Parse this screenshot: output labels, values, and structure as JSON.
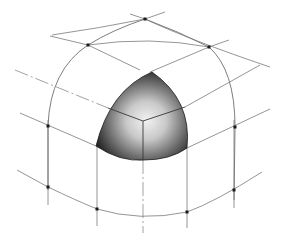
{
  "figure": {
    "colors": {
      "background": "#ffffff",
      "line": "#6e6e6e",
      "sphere_dark": "#1e1e1e",
      "sphere_light": "#e6e6e6",
      "dot": "#1a1a1a"
    },
    "vertices": [
      {
        "id": "top",
        "x": 145,
        "y": 19
      },
      {
        "id": "upper-left",
        "x": 88,
        "y": 45
      },
      {
        "id": "upper-right",
        "x": 209,
        "y": 47
      },
      {
        "id": "left",
        "x": 48,
        "y": 126
      },
      {
        "id": "right",
        "x": 235,
        "y": 127
      },
      {
        "id": "lower-left",
        "x": 48,
        "y": 187
      },
      {
        "id": "lower-mid-left",
        "x": 97,
        "y": 209
      },
      {
        "id": "lower-mid-right",
        "x": 187,
        "y": 212
      },
      {
        "id": "lower-right",
        "x": 234,
        "y": 190
      },
      {
        "id": "sphere-apex",
        "x": 152,
        "y": 72
      },
      {
        "id": "sphere-left",
        "x": 96,
        "y": 146
      },
      {
        "id": "sphere-right",
        "x": 187,
        "y": 148
      }
    ]
  }
}
